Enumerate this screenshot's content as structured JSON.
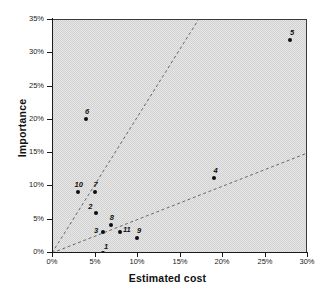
{
  "chart_data": {
    "type": "scatter",
    "title": "",
    "xlabel": "Estimated cost",
    "ylabel": "Importance",
    "xlim": [
      0,
      30
    ],
    "ylim": [
      0,
      35
    ],
    "grid": false,
    "legend": "none",
    "axis_unit": "percent",
    "x_ticks": [
      "0%",
      "5%",
      "10%",
      "15%",
      "20%",
      "25%",
      "30%"
    ],
    "x_tick_values": [
      0,
      5,
      10,
      15,
      20,
      25,
      30
    ],
    "y_ticks": [
      "0%",
      "5%",
      "10%",
      "15%",
      "20%",
      "25%",
      "30%",
      "35%"
    ],
    "y_tick_values": [
      0,
      5,
      10,
      15,
      20,
      25,
      30,
      35
    ],
    "points": [
      {
        "label": "1",
        "x": 6.0,
        "y": 0.0,
        "label_dx": 1,
        "label_dy": -10
      },
      {
        "label": "2",
        "x": 5.2,
        "y": 6.0,
        "label_dx": -8,
        "label_dy": -10
      },
      {
        "label": "3",
        "x": 6.0,
        "y": 3.1,
        "label_dx": -9,
        "label_dy": -5
      },
      {
        "label": "4",
        "x": 19.0,
        "y": 11.2,
        "label_dx": 0,
        "label_dy": -11
      },
      {
        "label": "5",
        "x": 28.0,
        "y": 32.0,
        "label_dx": 0,
        "label_dy": -11
      },
      {
        "label": "6",
        "x": 4.0,
        "y": 20.1,
        "label_dx": -1,
        "label_dy": -11
      },
      {
        "label": "7",
        "x": 5.0,
        "y": 9.1,
        "label_dx": -1,
        "label_dy": -11
      },
      {
        "label": "8",
        "x": 6.9,
        "y": 4.2,
        "label_dx": -1,
        "label_dy": -11
      },
      {
        "label": "9",
        "x": 10.0,
        "y": 2.2,
        "label_dx": 0,
        "label_dy": -11
      },
      {
        "label": "10",
        "x": 3.0,
        "y": 9.1,
        "label_dx": -3,
        "label_dy": -11
      },
      {
        "label": "11",
        "x": 8.0,
        "y": 3.1,
        "label_dx": 3,
        "label_dy": -6
      }
    ],
    "trend_lines": [
      {
        "name": "upper-ratio-line",
        "x0": 0,
        "y0": 0,
        "x1": 17.2,
        "y1": 35.0,
        "style": "dashed"
      },
      {
        "name": "lower-ratio-line",
        "x0": 0,
        "y0": 0,
        "x1": 30.0,
        "y1": 15.0,
        "style": "dashed"
      }
    ],
    "colors": {
      "plot_background": "#d2d2d2",
      "axis": "#1a1a1a",
      "point": "#0d0d0d",
      "trend_line": "#5a5a5a",
      "page_background": "#ffffff"
    }
  }
}
